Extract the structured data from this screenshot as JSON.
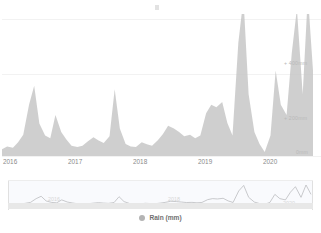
{
  "chart_data": {
    "type": "area",
    "title": "",
    "subtitle": "",
    "xlabel": "",
    "ylabel": "",
    "series_name": "Rain (mm)",
    "series_color": "#c4c4c4",
    "legend_position": "bottom",
    "grid": true,
    "ylim": [
      0,
      520
    ],
    "y_ticks": [
      {
        "value": 0,
        "label": "0mm"
      },
      {
        "value": 200,
        "label": "+ 200mm"
      },
      {
        "value": 400,
        "label": "+ 400mm"
      }
    ],
    "x_ticks": [
      {
        "value": 2016,
        "label": "2016"
      },
      {
        "value": 2017,
        "label": "2017"
      },
      {
        "value": 2018,
        "label": "2018"
      },
      {
        "value": 2019,
        "label": "2019"
      },
      {
        "value": 2020,
        "label": "2020"
      }
    ],
    "x": [
      2016.0,
      2016.08,
      2016.17,
      2016.25,
      2016.33,
      2016.42,
      2016.5,
      2016.58,
      2016.67,
      2016.75,
      2016.83,
      2016.92,
      2017.0,
      2017.08,
      2017.17,
      2017.25,
      2017.33,
      2017.42,
      2017.5,
      2017.58,
      2017.67,
      2017.75,
      2017.83,
      2017.92,
      2018.0,
      2018.08,
      2018.17,
      2018.25,
      2018.33,
      2018.42,
      2018.5,
      2018.58,
      2018.67,
      2018.75,
      2018.83,
      2018.92,
      2019.0,
      2019.08,
      2019.17,
      2019.25,
      2019.33,
      2019.42,
      2019.5,
      2019.58,
      2019.67,
      2019.75,
      2019.83,
      2019.92,
      2020.0,
      2020.08,
      2020.17,
      2020.25,
      2020.33,
      2020.42,
      2020.5,
      2020.58,
      2020.67,
      2020.75,
      2020.83
    ],
    "values": [
      20,
      28,
      24,
      40,
      62,
      150,
      205,
      95,
      60,
      52,
      120,
      70,
      48,
      30,
      26,
      30,
      42,
      55,
      45,
      38,
      58,
      195,
      80,
      35,
      28,
      26,
      40,
      34,
      30,
      46,
      64,
      88,
      80,
      70,
      58,
      62,
      52,
      60,
      125,
      150,
      142,
      158,
      96,
      60,
      330,
      460,
      180,
      70,
      35,
      12,
      60,
      250,
      150,
      120,
      300,
      430,
      180,
      470,
      250
    ],
    "annotations": []
  },
  "navigator": {
    "visible": true,
    "series_color": "#b8b8b8",
    "year_labels": [
      {
        "label": "2016",
        "x_pct": 14
      },
      {
        "label": "2018",
        "x_pct": 54
      },
      {
        "label": "2020",
        "x_pct": 91
      }
    ]
  },
  "legend": {
    "items": [
      {
        "label": "Rain (mm)",
        "marker_color": "#b4b4b4"
      }
    ]
  }
}
